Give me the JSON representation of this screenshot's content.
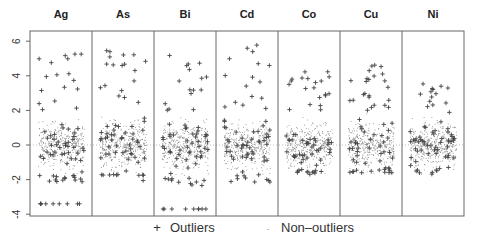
{
  "chart_data": {
    "type": "scatter",
    "title": "",
    "xlabel": "",
    "ylabel": "",
    "ylim": [
      -4,
      6.4
    ],
    "yticks": [
      6,
      4,
      2,
      0,
      -2,
      -4
    ],
    "reference_line_y": 0,
    "panels": [
      "Ag",
      "As",
      "Bi",
      "Cd",
      "Co",
      "Cu",
      "Ni"
    ],
    "series": [
      {
        "name": "Outliers",
        "marker": "+"
      },
      {
        "name": "Non-outliers",
        "marker": "."
      }
    ],
    "panel_summary": [
      {
        "panel": "Ag",
        "nonoutlier_range": [
          -2.0,
          2.0
        ],
        "outlier_range": [
          -3.4,
          5.4
        ],
        "detection_limit_row": -3.4
      },
      {
        "panel": "As",
        "nonoutlier_range": [
          -2.0,
          2.0
        ],
        "outlier_range": [
          -2.5,
          5.6
        ]
      },
      {
        "panel": "Bi",
        "nonoutlier_range": [
          -2.0,
          2.0
        ],
        "outlier_range": [
          -3.7,
          5.3
        ],
        "detection_limit_row": -3.7
      },
      {
        "panel": "Cd",
        "nonoutlier_range": [
          -2.0,
          2.0
        ],
        "outlier_range": [
          -3.3,
          6.1
        ]
      },
      {
        "panel": "Co",
        "nonoutlier_range": [
          -1.8,
          2.2
        ],
        "outlier_range": [
          -1.7,
          4.3
        ]
      },
      {
        "panel": "Cu",
        "nonoutlier_range": [
          -1.6,
          2.2
        ],
        "outlier_range": [
          -1.6,
          4.8
        ]
      },
      {
        "panel": "Ni",
        "nonoutlier_range": [
          -1.7,
          2.4
        ],
        "outlier_range": [
          -1.7,
          3.6
        ]
      }
    ],
    "grid": false,
    "legend_position": "bottom"
  },
  "legend": {
    "outliers_label": "Outliers",
    "nonoutliers_label": "Non–outliers",
    "outlier_symbol": "+",
    "nonoutlier_symbol": "."
  }
}
